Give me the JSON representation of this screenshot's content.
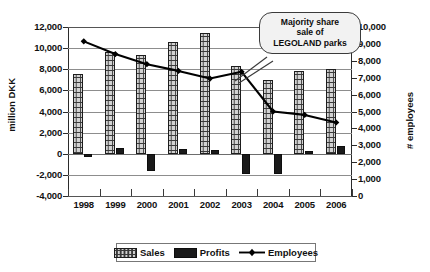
{
  "chart_data": {
    "type": "bar",
    "title": "",
    "subtitle": "",
    "xlabel": "",
    "ylabel": "million DKK",
    "y2label": "# employees",
    "categories": [
      "1998",
      "1999",
      "2000",
      "2001",
      "2002",
      "2003",
      "2004",
      "2005",
      "2006"
    ],
    "ylim": [
      -4000,
      12000
    ],
    "y2lim": [
      0,
      10000
    ],
    "yticks": [
      "12,000",
      "10,000",
      "8,000",
      "6,000",
      "4,000",
      "2,000",
      "0",
      "-2,000",
      "-4,000"
    ],
    "ytick_values": [
      12000,
      10000,
      8000,
      6000,
      4000,
      2000,
      0,
      -2000,
      -4000
    ],
    "y2ticks": [
      "10,000",
      "9,000",
      "8,000",
      "7,000",
      "6,000",
      "5,000",
      "4,000",
      "3,000",
      "2,000",
      "1,000",
      "0"
    ],
    "y2tick_values": [
      10000,
      9000,
      8000,
      7000,
      6000,
      5000,
      4000,
      3000,
      2000,
      1000,
      0
    ],
    "grid": true,
    "legend_position": "bottom",
    "series": [
      {
        "name": "Sales",
        "axis": "left",
        "kind": "bar",
        "unit": "million DKK",
        "values": [
          7550,
          9650,
          9350,
          10550,
          11450,
          8350,
          6950,
          7800,
          8000
        ]
      },
      {
        "name": "Profits",
        "axis": "left",
        "kind": "bar",
        "unit": "million DKK",
        "values": [
          -300,
          500,
          -1600,
          450,
          400,
          -1900,
          -1900,
          300,
          700
        ]
      },
      {
        "name": "Employees",
        "axis": "right",
        "kind": "line",
        "unit": "# employees",
        "values": [
          9150,
          8400,
          7800,
          7400,
          6950,
          7350,
          5000,
          4800,
          4350
        ]
      }
    ],
    "annotations": [
      {
        "name": "legoland-sale-callout",
        "lines": [
          "Majority share",
          "sale of",
          "LEGOLAND parks"
        ],
        "points_to_category": "2003"
      }
    ],
    "colors": {
      "sales_fill": "#d2d2d2",
      "sales_outline": "#1d1d1d",
      "profits_fill": "#1a1a1a",
      "employees_line": "#000000",
      "gridline": "#8d8d8d",
      "axis": "#2b2b2b",
      "callout_bg": "#f2f2f2"
    }
  },
  "legend": {
    "items": [
      {
        "label": "Sales",
        "icon": "hatched-square-icon"
      },
      {
        "label": "Profits",
        "icon": "filled-square-icon"
      },
      {
        "label": "Employees",
        "icon": "line-diamond-icon"
      }
    ]
  },
  "axes": {
    "left_title": "million DKK",
    "right_title": "# employees"
  }
}
